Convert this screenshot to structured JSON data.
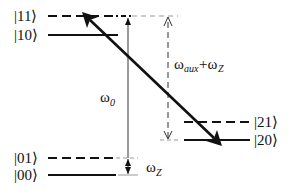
{
  "diagram": {
    "type": "energy-level-diagram",
    "levels": [
      {
        "label": "|11⟩",
        "style": "dashed"
      },
      {
        "label": "|10⟩",
        "style": "solid"
      },
      {
        "label": "|01⟩",
        "style": "dashed"
      },
      {
        "label": "|00⟩",
        "style": "solid"
      },
      {
        "label": "|21⟩",
        "style": "dashed"
      },
      {
        "label": "|20⟩",
        "style": "solid"
      }
    ],
    "annotations": {
      "omega0": {
        "base": "ω",
        "sub": "0"
      },
      "omegaZ": {
        "base": "ω",
        "sub": "Z"
      },
      "omegaAuxZ": {
        "base1": "ω",
        "sub1": "aux",
        "plus": "+ω",
        "sub2": "Z"
      }
    },
    "transition": {
      "from": "|11⟩",
      "to": "|20⟩",
      "style": "bold-double-arrow"
    }
  }
}
